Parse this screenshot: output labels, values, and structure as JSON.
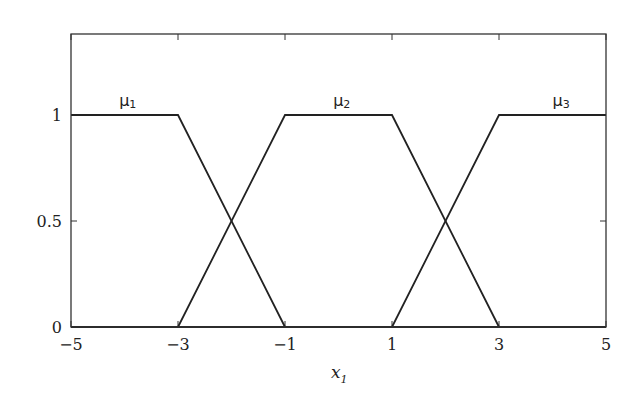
{
  "chart_data": {
    "type": "line",
    "title": "",
    "xlabel": "x",
    "xlabel_subscript": "1",
    "ylabel": "",
    "xlim": [
      -5,
      5
    ],
    "ylim": [
      0,
      1.38
    ],
    "grid": false,
    "legend": "none (inline curve labels)",
    "xticks": [
      -5,
      -3,
      -1,
      1,
      3,
      5
    ],
    "xtick_labels": [
      "−5",
      "−3",
      "−1",
      "1",
      "3",
      "5"
    ],
    "yticks": [
      0,
      0.5,
      1
    ],
    "ytick_labels": [
      "0",
      "0.5",
      "1"
    ],
    "line_color": "#222222",
    "series": [
      {
        "name": "μ1",
        "label": "μ",
        "sub": "1",
        "label_x": -4.1,
        "x": [
          -5,
          -3,
          -1,
          5
        ],
        "y": [
          1,
          1,
          0,
          0
        ]
      },
      {
        "name": "μ2",
        "label": "μ",
        "sub": "2",
        "label_x": -0.1,
        "x": [
          -5,
          -3,
          -1,
          1,
          3,
          5
        ],
        "y": [
          0,
          0,
          1,
          1,
          0,
          0
        ]
      },
      {
        "name": "μ3",
        "label": "μ",
        "sub": "3",
        "label_x": 4.0,
        "x": [
          -5,
          1,
          3,
          5
        ],
        "y": [
          0,
          0,
          1,
          1
        ]
      }
    ]
  }
}
